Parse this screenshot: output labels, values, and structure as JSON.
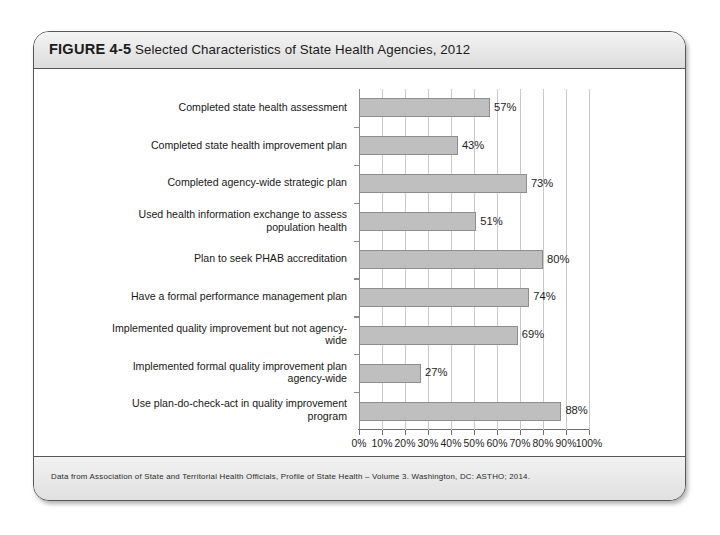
{
  "figure": {
    "number_label": "FIGURE 4-5",
    "title": "Selected Characteristics of State Health Agencies, 2012",
    "source_note": "Data from Association of State and Territorial Health Officials, Profile of State Health – Volume 3. Washington, DC: ASTHO; 2014."
  },
  "chart_data": {
    "type": "bar",
    "orientation": "horizontal",
    "title": "Selected Characteristics of State Health Agencies, 2012",
    "xlabel": "",
    "ylabel": "",
    "xlim": [
      0,
      100
    ],
    "grid": true,
    "legend": false,
    "tick_suffix": "%",
    "xticks": [
      "0%",
      "10%",
      "20%",
      "30%",
      "40%",
      "50%",
      "60%",
      "70%",
      "80%",
      "90%",
      "100%"
    ],
    "xtick_values": [
      0,
      10,
      20,
      30,
      40,
      50,
      60,
      70,
      80,
      90,
      100
    ],
    "categories": [
      "Completed state health assessment",
      "Completed state health improvement plan",
      "Completed agency-wide strategic plan",
      "Used health information exchange to assess\npopulation health",
      "Plan to seek PHAB accreditation",
      "Have a formal performance management plan",
      "Implemented quality improvement but not agency-\nwide",
      "Implemented formal quality improvement plan\nagency-wide",
      "Use plan-do-check-act in quality improvement\nprogram"
    ],
    "values": [
      57,
      43,
      73,
      51,
      80,
      74,
      69,
      27,
      88
    ],
    "value_labels": [
      "57%",
      "43%",
      "73%",
      "51%",
      "80%",
      "74%",
      "69%",
      "27%",
      "88%"
    ],
    "bar_color": "#bfbfbf",
    "bar_border_color": "#8d8d8d",
    "gridline_color": "#c9c9c9",
    "axis_color": "#6f6f6f"
  }
}
